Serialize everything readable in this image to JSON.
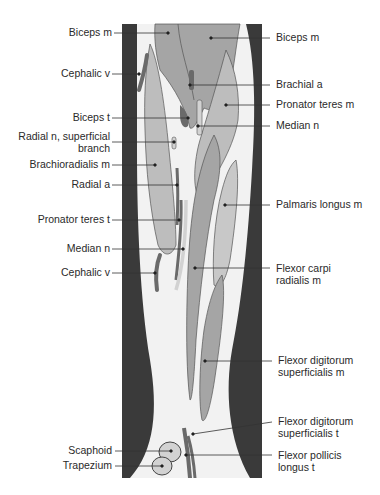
{
  "figure": {
    "colors": {
      "skin_dark": "#3a3a3a",
      "subcutaneous": "#f2f2f2",
      "muscle_light": "#bdbdbd",
      "muscle_mid": "#a5a5a5",
      "vessel_dark": "#6a6a6a",
      "nerve": "#d2d2d2",
      "outline": "#555555",
      "leader_line": "#333333",
      "text": "#2a2a2a"
    }
  },
  "labels_left": [
    {
      "id": "biceps-m-left",
      "text": "Biceps m"
    },
    {
      "id": "cephalic-v-upper",
      "text": "Cephalic v"
    },
    {
      "id": "biceps-t",
      "text": "Biceps t"
    },
    {
      "id": "radial-n-superficial-branch",
      "text": "Radial n, superficial\nbranch"
    },
    {
      "id": "brachioradialis-m",
      "text": "Brachioradialis m"
    },
    {
      "id": "radial-a",
      "text": "Radial a"
    },
    {
      "id": "pronator-teres-t",
      "text": "Pronator teres t"
    },
    {
      "id": "median-n-lower",
      "text": "Median n"
    },
    {
      "id": "cephalic-v-lower",
      "text": "Cephalic v"
    },
    {
      "id": "scaphoid",
      "text": "Scaphoid"
    },
    {
      "id": "trapezium",
      "text": "Trapezium"
    }
  ],
  "labels_right": [
    {
      "id": "biceps-m-right",
      "text": "Biceps m"
    },
    {
      "id": "brachial-a",
      "text": "Brachial a"
    },
    {
      "id": "pronator-teres-m",
      "text": "Pronator teres m"
    },
    {
      "id": "median-n-upper",
      "text": "Median n"
    },
    {
      "id": "palmaris-longus-m",
      "text": "Palmaris longus m"
    },
    {
      "id": "flexor-carpi-radialis-m",
      "text": "Flexor carpi\nradialis m"
    },
    {
      "id": "flexor-digitorum-superficialis-m",
      "text": "Flexor digitorum\nsuperficialis m"
    },
    {
      "id": "flexor-digitorum-superficialis-t",
      "text": "Flexor digitorum\nsuperficialis t"
    },
    {
      "id": "flexor-pollicis-longus-t",
      "text": "Flexor pollicis\nlongus t"
    }
  ]
}
